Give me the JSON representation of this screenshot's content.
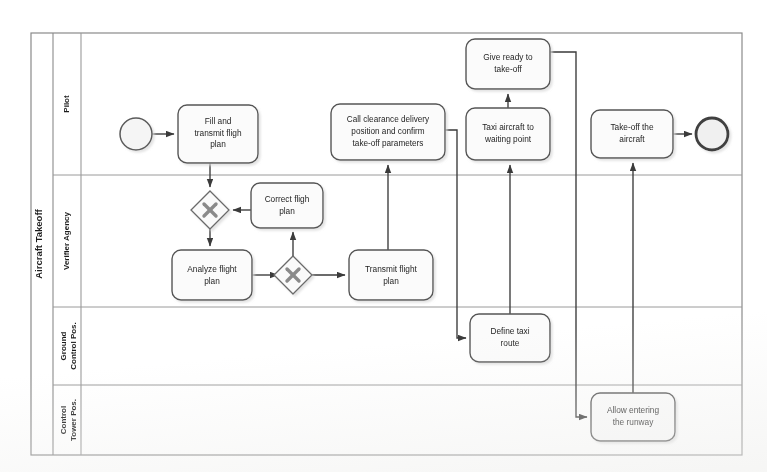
{
  "pool": {
    "label": "Aircraft Takeoff",
    "x": 31,
    "y": 33,
    "width": 711,
    "height": 422,
    "header_width": 22,
    "lane_header_width": 28
  },
  "lanes": [
    {
      "id": "pilot",
      "label": "Pilot",
      "y": 33,
      "height": 142
    },
    {
      "id": "verifier-agency",
      "label": "Verifier Agency",
      "y": 175,
      "height": 132
    },
    {
      "id": "ground-control",
      "label": "Ground\nControl Pos.",
      "label_line1": "Ground",
      "label_line2": "Control Pos.",
      "y": 307,
      "height": 78
    },
    {
      "id": "control-tower",
      "label": "Control\nTower Pos.",
      "label_line1": "Control",
      "label_line2": "Tower Pos.",
      "y": 385,
      "height": 70
    }
  ],
  "events": [
    {
      "id": "start-event",
      "type": "start",
      "cx": 136,
      "cy": 134,
      "r": 16
    },
    {
      "id": "end-event",
      "type": "end",
      "cx": 712,
      "cy": 134,
      "r": 16
    }
  ],
  "tasks": [
    {
      "id": "fill-transmit-flight-plan",
      "lines": [
        "Fill and",
        "transmit fligh",
        "plan"
      ],
      "x": 178,
      "y": 105,
      "width": 80,
      "height": 58,
      "lane": "pilot"
    },
    {
      "id": "correct-flight-plan",
      "lines": [
        "Correct fligh",
        "plan"
      ],
      "x": 251,
      "y": 183,
      "width": 72,
      "height": 45,
      "lane": "verifier-agency"
    },
    {
      "id": "analyze-flight-plan",
      "lines": [
        "Analyze flight",
        "plan"
      ],
      "x": 172,
      "y": 250,
      "width": 80,
      "height": 50,
      "lane": "verifier-agency"
    },
    {
      "id": "transmit-flight-plan",
      "lines": [
        "Transmit flight",
        "plan"
      ],
      "x": 349,
      "y": 250,
      "width": 84,
      "height": 50,
      "lane": "verifier-agency"
    },
    {
      "id": "call-clearance-delivery",
      "lines": [
        "Call clearance delivery",
        "position and confirm",
        "take-off parameters"
      ],
      "x": 331,
      "y": 104,
      "width": 114,
      "height": 56,
      "lane": "pilot"
    },
    {
      "id": "taxi-aircraft-waiting-point",
      "lines": [
        "Taxi aircraft to",
        "waiting point"
      ],
      "x": 466,
      "y": 108,
      "width": 84,
      "height": 52,
      "lane": "pilot"
    },
    {
      "id": "give-ready-to-take-off",
      "lines": [
        "Give ready to",
        "take-off"
      ],
      "x": 466,
      "y": 39,
      "width": 84,
      "height": 50,
      "lane": "pilot"
    },
    {
      "id": "take-off-the-aircraft",
      "lines": [
        "Take-off the",
        "aircraft"
      ],
      "x": 591,
      "y": 110,
      "width": 82,
      "height": 48,
      "lane": "pilot"
    },
    {
      "id": "define-taxi-route",
      "lines": [
        "Define taxi",
        "route"
      ],
      "x": 470,
      "y": 314,
      "width": 80,
      "height": 48,
      "lane": "ground-control"
    },
    {
      "id": "allow-entering-runway",
      "lines": [
        "Allow entering",
        "the runway"
      ],
      "x": 591,
      "y": 393,
      "width": 84,
      "height": 48,
      "lane": "control-tower"
    }
  ],
  "gateways": [
    {
      "id": "gateway-plan-valid",
      "type": "exclusive",
      "cx": 210,
      "cy": 210,
      "half": 19,
      "symbol": "X"
    },
    {
      "id": "gateway-plan-check",
      "type": "exclusive",
      "cx": 293,
      "cy": 275,
      "half": 19,
      "symbol": "X"
    }
  ],
  "flows": [
    {
      "id": "flow-start-to-fill",
      "from": "start-event",
      "to": "fill-transmit-flight-plan",
      "points": "152,134 178,134"
    },
    {
      "id": "flow-fill-to-gateway1",
      "from": "fill-transmit-flight-plan",
      "to": "gateway-plan-valid",
      "points": "210,163 210,191"
    },
    {
      "id": "flow-correct-to-gateway1",
      "from": "correct-flight-plan",
      "to": "gateway-plan-valid",
      "points": "251,210 229,210"
    },
    {
      "id": "flow-gateway1-to-analyze",
      "from": "gateway-plan-valid",
      "to": "analyze-flight-plan",
      "points": "210,229 210,250"
    },
    {
      "id": "flow-analyze-to-gateway2",
      "from": "analyze-flight-plan",
      "to": "gateway-plan-check",
      "points": "252,275 274,275"
    },
    {
      "id": "flow-gateway2-to-correct",
      "from": "gateway-plan-check",
      "to": "correct-flight-plan",
      "points": "293,256 293,228"
    },
    {
      "id": "flow-gateway2-to-transmit",
      "from": "gateway-plan-check",
      "to": "transmit-flight-plan",
      "points": "312,275 349,275"
    },
    {
      "id": "flow-transmit-to-call",
      "from": "transmit-flight-plan",
      "to": "call-clearance-delivery",
      "points": "388,250 388,160"
    },
    {
      "id": "flow-call-to-define-taxi",
      "from": "call-clearance-delivery",
      "to": "define-taxi-route",
      "points": "445,132 456,132 456,338 470,338"
    },
    {
      "id": "flow-define-to-taxi-aircraft",
      "from": "define-taxi-route",
      "to": "taxi-aircraft-waiting-point",
      "points": "510,314 510,160"
    },
    {
      "id": "flow-taxi-to-give-ready",
      "from": "taxi-aircraft-waiting-point",
      "to": "give-ready-to-take-off",
      "points": "508,108 508,89"
    },
    {
      "id": "flow-give-ready-to-allow",
      "from": "give-ready-to-take-off",
      "to": "allow-entering-runway",
      "points": "550,52 575,52 575,417 591,417"
    },
    {
      "id": "flow-allow-to-takeoff",
      "from": "allow-entering-runway",
      "to": "take-off-the-aircraft",
      "points": "633,393 633,158"
    },
    {
      "id": "flow-takeoff-to-end",
      "from": "take-off-the-aircraft",
      "to": "end-event",
      "points": "673,134 696,134"
    }
  ],
  "style": {
    "stroke": "#4a4a4a",
    "task_fill": "#fbfbfb",
    "task_stroke": "#555555",
    "gateway_fill": "#fafafa",
    "gateway_symbol": "#888888",
    "event_stroke": "#5a5a5a",
    "event_fill": "#f5f5f5",
    "lane_line": "#9a9a9a",
    "pool_line": "#8a8a8a",
    "text": "#1f1f1f",
    "shadow": "#bdbdbd"
  }
}
